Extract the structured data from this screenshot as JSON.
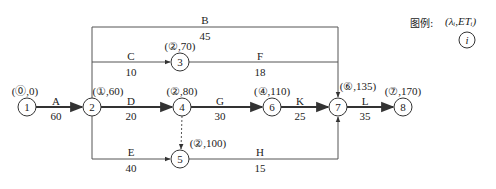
{
  "diagram": {
    "type": "double-code network diagram (activity-on-arrow) with labeling method",
    "legend": {
      "title": "图例:",
      "formula": "(λᵢ,ETᵢ)",
      "node_symbol": "i"
    },
    "nodes": [
      {
        "id": "1",
        "x": 27,
        "y": 107,
        "label": "(⓪,0)",
        "label_x": 25,
        "label_y": 85
      },
      {
        "id": "2",
        "x": 92,
        "y": 107,
        "label": "(①,60)",
        "label_x": 108,
        "label_y": 85
      },
      {
        "id": "3",
        "x": 180,
        "y": 62,
        "label": "(②,70)",
        "label_x": 180,
        "label_y": 40
      },
      {
        "id": "4",
        "x": 182,
        "y": 107,
        "label": "(②,80)",
        "label_x": 182,
        "label_y": 85
      },
      {
        "id": "5",
        "x": 180,
        "y": 159,
        "label": "(②,100)",
        "label_x": 208,
        "label_y": 137
      },
      {
        "id": "6",
        "x": 272,
        "y": 107,
        "label": "(④,110)",
        "label_x": 272,
        "label_y": 85
      },
      {
        "id": "7",
        "x": 338,
        "y": 107,
        "label": "(⑥,135)",
        "label_x": 358,
        "label_y": 80
      },
      {
        "id": "8",
        "x": 403,
        "y": 107,
        "label": "(⑦,170)",
        "label_x": 403,
        "label_y": 85
      }
    ],
    "activities": [
      {
        "name": "A",
        "duration": "60",
        "from": "1",
        "to": "2",
        "critical": true
      },
      {
        "name": "B",
        "duration": "45",
        "from": "2",
        "to": "7",
        "critical": false
      },
      {
        "name": "C",
        "duration": "10",
        "from": "2",
        "to": "3",
        "critical": false
      },
      {
        "name": "D",
        "duration": "20",
        "from": "2",
        "to": "4",
        "critical": true
      },
      {
        "name": "E",
        "duration": "40",
        "from": "2",
        "to": "5",
        "critical": false
      },
      {
        "name": "F",
        "duration": "18",
        "from": "3",
        "to": "7",
        "critical": false
      },
      {
        "name": "G",
        "duration": "30",
        "from": "4",
        "to": "6",
        "critical": true
      },
      {
        "name": "H",
        "duration": "15",
        "from": "5",
        "to": "7",
        "critical": false
      },
      {
        "name": "K",
        "duration": "25",
        "from": "6",
        "to": "7",
        "critical": true
      },
      {
        "name": "L",
        "duration": "35",
        "from": "7",
        "to": "8",
        "critical": true
      },
      {
        "name": "dummy",
        "duration": "",
        "from": "4",
        "to": "5",
        "critical": false,
        "dashed": true
      }
    ],
    "activity_labels": {
      "A": {
        "name_x": 56,
        "name_y": 95,
        "dur_x": 56,
        "dur_y": 110
      },
      "B": {
        "name_x": 205,
        "name_y": 14,
        "dur_x": 205,
        "dur_y": 30
      },
      "C": {
        "name_x": 131,
        "name_y": 50,
        "dur_x": 131,
        "dur_y": 66
      },
      "D": {
        "name_x": 131,
        "name_y": 95,
        "dur_x": 131,
        "dur_y": 110
      },
      "E": {
        "name_x": 131,
        "name_y": 146,
        "dur_x": 131,
        "dur_y": 162
      },
      "F": {
        "name_x": 260,
        "name_y": 50,
        "dur_x": 260,
        "dur_y": 66
      },
      "G": {
        "name_x": 220,
        "name_y": 95,
        "dur_x": 220,
        "dur_y": 110
      },
      "H": {
        "name_x": 260,
        "name_y": 146,
        "dur_x": 260,
        "dur_y": 162
      },
      "K": {
        "name_x": 300,
        "name_y": 95,
        "dur_x": 300,
        "dur_y": 110
      },
      "L": {
        "name_x": 365,
        "name_y": 95,
        "dur_x": 365,
        "dur_y": 110
      }
    },
    "critical_path": [
      "1",
      "2",
      "4",
      "6",
      "7",
      "8"
    ],
    "total_duration": "170",
    "colors": {
      "line": "#444444",
      "critical_line": "#333333",
      "text": "#222222",
      "background": "#ffffff"
    }
  }
}
